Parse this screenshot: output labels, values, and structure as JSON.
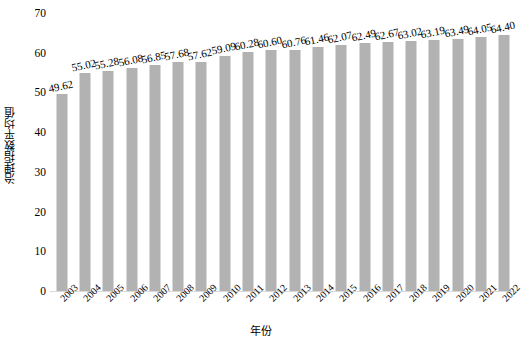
{
  "chart_data": {
    "type": "bar",
    "title": "",
    "xlabel": "年份",
    "ylabel": "治理指数平均值",
    "categories": [
      "2003",
      "2004",
      "2005",
      "2006",
      "2007",
      "2008",
      "2009",
      "2010",
      "2011",
      "2012",
      "2013",
      "2014",
      "2015",
      "2016",
      "2017",
      "2018",
      "2019",
      "2020",
      "2021",
      "2022"
    ],
    "values": [
      49.62,
      55.02,
      55.28,
      56.08,
      56.85,
      57.68,
      57.62,
      59.09,
      60.28,
      60.6,
      60.76,
      61.46,
      62.07,
      62.49,
      62.67,
      63.02,
      63.19,
      63.49,
      64.05,
      64.4
    ],
    "data_labels": [
      "49.62",
      "55.02",
      "55.28",
      "56.08",
      "56.85",
      "57.68",
      "57.62",
      "59.09",
      "60.28",
      "60.60",
      "60.76",
      "61.46",
      "62.07",
      "62.49",
      "62.67",
      "63.02",
      "63.19",
      "63.49",
      "64.05",
      "64.40"
    ],
    "ylim": [
      0,
      70
    ],
    "yticks": [
      0,
      10,
      20,
      30,
      40,
      50,
      60,
      70
    ],
    "ytick_labels": [
      "0",
      "10",
      "20",
      "30",
      "40",
      "50",
      "60",
      "70"
    ],
    "grid": false,
    "legend": null,
    "series": [
      {
        "name": "治理指数平均值",
        "values": [
          49.62,
          55.02,
          55.28,
          56.08,
          56.85,
          57.68,
          57.62,
          59.09,
          60.28,
          60.6,
          60.76,
          61.46,
          62.07,
          62.49,
          62.67,
          63.02,
          63.19,
          63.49,
          64.05,
          64.4
        ]
      }
    ],
    "colors": {
      "bar_fill": "#b2b2b2",
      "axis_line": "#d9d9d9",
      "text": "#000000",
      "background": "#ffffff"
    }
  }
}
